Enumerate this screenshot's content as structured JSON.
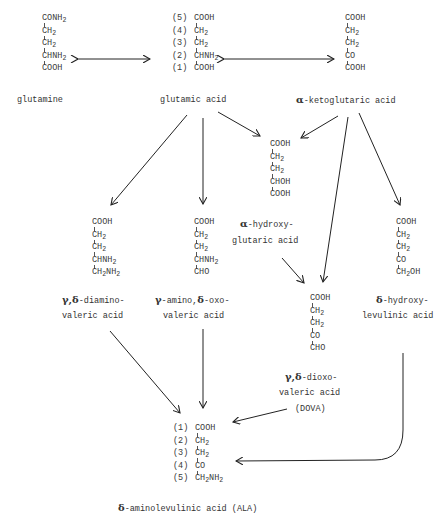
{
  "compounds": {
    "glutamine": {
      "name": "glutamine",
      "rows": [
        "CONH|2",
        "CH|2",
        "CH|2",
        "CHNH|2",
        "COOH"
      ]
    },
    "glutamic_acid": {
      "name": "glutamic acid",
      "numbers": [
        "(5)",
        "(4)",
        "(3)",
        "(2)",
        "(1)"
      ],
      "rows": [
        "COOH",
        "CH|2",
        "CH|2",
        "CHNH|2",
        "COOH"
      ]
    },
    "alpha_ketoglutaric_acid": {
      "name_prefix": "α",
      "name": "-ketoglutaric acid",
      "rows": [
        "COOH",
        "CH|2",
        "CH|2",
        "CO",
        "COOH"
      ]
    },
    "alpha_hydroxyglutaric_acid": {
      "name_prefix": "α",
      "name_line1": "-hydroxy-",
      "name_line2": "glutaric acid",
      "rows": [
        "COOH",
        "CH|2",
        "CH|2",
        "CHOH",
        "COOH"
      ]
    },
    "gamma_delta_diaminovaleric_acid": {
      "name_prefix": "γ,δ",
      "name_line1": "-diamino-",
      "name_line2": "valeric acid",
      "rows": [
        "COOH",
        "CH|2",
        "CH|2",
        "CHNH|2",
        "CH|2|NH|2"
      ]
    },
    "gamma_amino_delta_oxovaleric_acid": {
      "name_prefix1": "γ",
      "name_mid": "-amino,",
      "name_prefix2": "δ",
      "name_line1_end": "-oxo-",
      "name_line2": "valeric acid",
      "rows": [
        "COOH",
        "CH|2",
        "CH|2",
        "CHNH|2",
        "CHO"
      ]
    },
    "dova": {
      "name_prefix": "γ,δ",
      "name_line1": "-dioxo-",
      "name_line2": "valeric acid",
      "name_line3": "(DOVA)",
      "rows": [
        "COOH",
        "CH|2",
        "CH|2",
        "CO",
        "CHO"
      ]
    },
    "delta_hydroxylevulinic_acid": {
      "name_prefix": "δ",
      "name_line1": "-hydroxy-",
      "name_line2": "levulinic acid",
      "rows": [
        "COOH",
        "CH|2",
        "CH|2",
        "CO",
        "CH|2|OH"
      ]
    },
    "ala": {
      "name_prefix": "δ",
      "name": "-aminolevulinic acid (ALA)",
      "numbers": [
        "(1)",
        "(2)",
        "(3)",
        "(4)",
        "(5)"
      ],
      "rows": [
        "COOH",
        "CH|2",
        "CH|2",
        "CO",
        "CH|2|NH|2"
      ]
    }
  },
  "edges": [
    {
      "from": "glutamic acid",
      "to": "glutamine",
      "type": "single-arrow"
    },
    {
      "from": "glutamic acid",
      "to": "α-ketoglutaric acid",
      "type": "double-arrow"
    },
    {
      "from": "glutamic acid",
      "to": "γ,δ-diaminovaleric acid"
    },
    {
      "from": "glutamic acid",
      "to": "γ-amino,δ-oxovaleric acid"
    },
    {
      "from": "glutamic acid",
      "to": "α-hydroxyglutaric acid"
    },
    {
      "from": "α-ketoglutaric acid",
      "to": "α-hydroxyglutaric acid"
    },
    {
      "from": "α-ketoglutaric acid",
      "to": "γ,δ-dioxovaleric acid (DOVA)"
    },
    {
      "from": "α-ketoglutaric acid",
      "to": "δ-hydroxylevulinic acid"
    },
    {
      "from": "α-hydroxyglutaric acid",
      "to": "γ,δ-dioxovaleric acid (DOVA)"
    },
    {
      "from": "γ,δ-diaminovaleric acid",
      "to": "δ-aminolevulinic acid (ALA)"
    },
    {
      "from": "γ-amino,δ-oxovaleric acid",
      "to": "δ-aminolevulinic acid (ALA)"
    },
    {
      "from": "γ,δ-dioxovaleric acid (DOVA)",
      "to": "δ-aminolevulinic acid (ALA)"
    },
    {
      "from": "δ-hydroxylevulinic acid",
      "to": "δ-aminolevulinic acid (ALA)"
    }
  ]
}
